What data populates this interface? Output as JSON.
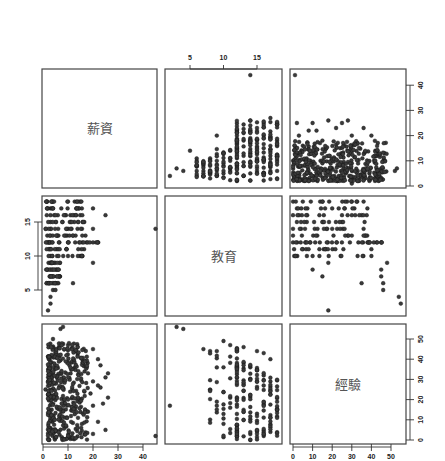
{
  "chart_data": {
    "type": "scatter",
    "subtype": "scatterplot-matrix",
    "title": "",
    "variables": [
      "薪資",
      "教育",
      "經驗"
    ],
    "variable_ranges": {
      "薪資": [
        0,
        45
      ],
      "教育": [
        2,
        18
      ],
      "經驗": [
        0,
        55
      ]
    },
    "axes": {
      "top": {
        "variable": "教育",
        "ticks": [
          5,
          10,
          15
        ]
      },
      "right_row1": {
        "variable": "薪資",
        "ticks": [
          0,
          10,
          20,
          30,
          40
        ]
      },
      "left_row2": {
        "variable": "教育",
        "ticks": [
          5,
          10,
          15
        ]
      },
      "right_row3": {
        "variable": "經驗",
        "ticks": [
          0,
          10,
          20,
          30,
          40,
          50
        ]
      },
      "bottom_col1": {
        "variable": "薪資",
        "ticks": [
          0,
          10,
          20,
          30,
          40
        ]
      },
      "bottom_col3": {
        "variable": "經驗",
        "ticks": [
          0,
          10,
          20,
          30,
          40,
          50
        ]
      }
    },
    "grid": false,
    "legend": null,
    "sample_points": {
      "education_salary": [
        [
          2,
          4
        ],
        [
          3,
          7
        ],
        [
          4,
          6
        ],
        [
          5,
          14
        ],
        [
          6,
          4
        ],
        [
          6,
          6
        ],
        [
          7,
          4
        ],
        [
          7,
          6
        ],
        [
          7,
          8
        ],
        [
          8,
          5
        ],
        [
          8,
          8
        ],
        [
          8,
          11
        ],
        [
          9,
          4
        ],
        [
          9,
          7
        ],
        [
          9,
          10
        ],
        [
          9,
          20
        ],
        [
          10,
          5
        ],
        [
          10,
          8
        ],
        [
          10,
          13
        ],
        [
          11,
          6
        ],
        [
          11,
          10
        ],
        [
          11,
          14
        ],
        [
          12,
          2
        ],
        [
          12,
          5
        ],
        [
          12,
          8
        ],
        [
          12,
          11
        ],
        [
          12,
          15
        ],
        [
          12,
          20
        ],
        [
          12,
          22
        ],
        [
          13,
          4
        ],
        [
          13,
          8
        ],
        [
          13,
          12
        ],
        [
          13,
          18
        ],
        [
          13,
          21
        ],
        [
          14,
          5
        ],
        [
          14,
          9
        ],
        [
          14,
          13
        ],
        [
          14,
          17
        ],
        [
          14,
          22
        ],
        [
          14,
          26
        ],
        [
          14,
          44
        ],
        [
          15,
          6
        ],
        [
          15,
          10
        ],
        [
          15,
          17
        ],
        [
          15,
          23
        ],
        [
          16,
          5
        ],
        [
          16,
          10
        ],
        [
          16,
          15
        ],
        [
          16,
          20
        ],
        [
          16,
          25
        ],
        [
          17,
          6
        ],
        [
          17,
          12
        ],
        [
          17,
          19
        ],
        [
          17,
          27
        ],
        [
          18,
          6
        ],
        [
          18,
          12
        ],
        [
          18,
          18
        ],
        [
          18,
          25
        ]
      ],
      "experience_salary": [
        [
          1,
          44
        ],
        [
          0,
          10
        ],
        [
          2,
          25
        ],
        [
          3,
          20
        ],
        [
          5,
          16
        ],
        [
          8,
          22
        ],
        [
          10,
          25
        ],
        [
          12,
          22
        ],
        [
          15,
          18
        ],
        [
          18,
          26
        ],
        [
          22,
          23
        ],
        [
          25,
          25
        ],
        [
          28,
          26
        ],
        [
          30,
          20
        ],
        [
          33,
          17
        ],
        [
          36,
          23
        ],
        [
          40,
          20
        ],
        [
          42,
          14
        ],
        [
          45,
          7
        ],
        [
          52,
          6
        ],
        [
          53,
          7
        ],
        [
          3,
          5
        ],
        [
          6,
          8
        ],
        [
          9,
          10
        ],
        [
          12,
          7
        ],
        [
          15,
          9
        ],
        [
          18,
          6
        ],
        [
          21,
          11
        ],
        [
          24,
          8
        ],
        [
          27,
          5
        ],
        [
          30,
          9
        ],
        [
          33,
          6
        ],
        [
          36,
          4
        ],
        [
          39,
          5
        ],
        [
          42,
          3
        ],
        [
          30,
          1
        ]
      ],
      "salary_education": [
        [
          2,
          2
        ],
        [
          3,
          3
        ],
        [
          3,
          4
        ],
        [
          4,
          5
        ],
        [
          5,
          5
        ],
        [
          2,
          6
        ],
        [
          3,
          7
        ],
        [
          3,
          8
        ],
        [
          3,
          9
        ],
        [
          3,
          10
        ],
        [
          3,
          11
        ],
        [
          2,
          12
        ],
        [
          3,
          13
        ],
        [
          3,
          14
        ],
        [
          3,
          15
        ],
        [
          3,
          16
        ],
        [
          3,
          17
        ],
        [
          4,
          18
        ],
        [
          10,
          18
        ],
        [
          15,
          18
        ],
        [
          20,
          17
        ],
        [
          25,
          16
        ],
        [
          20,
          14
        ],
        [
          12,
          13
        ],
        [
          17,
          13
        ],
        [
          10,
          12
        ],
        [
          20,
          12
        ],
        [
          45,
          14
        ],
        [
          20,
          9
        ],
        [
          12,
          6
        ],
        [
          14,
          15
        ]
      ],
      "experience_education": [
        [
          5,
          18
        ],
        [
          15,
          18
        ],
        [
          30,
          18
        ],
        [
          36,
          18
        ],
        [
          2,
          17
        ],
        [
          20,
          17
        ],
        [
          0,
          16
        ],
        [
          25,
          16
        ],
        [
          30,
          16
        ],
        [
          35,
          16
        ],
        [
          2,
          15
        ],
        [
          25,
          15
        ],
        [
          0,
          14
        ],
        [
          20,
          14
        ],
        [
          36,
          14
        ],
        [
          0,
          13
        ],
        [
          30,
          13
        ],
        [
          0,
          12
        ],
        [
          45,
          12
        ],
        [
          5,
          11
        ],
        [
          40,
          11
        ],
        [
          10,
          10
        ],
        [
          40,
          10
        ],
        [
          18,
          9
        ],
        [
          48,
          9
        ],
        [
          10,
          8
        ],
        [
          45,
          8
        ],
        [
          15,
          7
        ],
        [
          45,
          7
        ],
        [
          35,
          6
        ],
        [
          46,
          6
        ],
        [
          46,
          5
        ],
        [
          54,
          4
        ],
        [
          55,
          3
        ],
        [
          18,
          2
        ]
      ],
      "salary_experience": [
        [
          7,
          55
        ],
        [
          8,
          56
        ],
        [
          4,
          50
        ],
        [
          10,
          47
        ],
        [
          5,
          45
        ],
        [
          20,
          45
        ],
        [
          13,
          44
        ],
        [
          22,
          40
        ],
        [
          16,
          38
        ],
        [
          23,
          37
        ],
        [
          18,
          33
        ],
        [
          26,
          33
        ],
        [
          25,
          31
        ],
        [
          20,
          29
        ],
        [
          22,
          27
        ],
        [
          1,
          25
        ],
        [
          23,
          26
        ],
        [
          19,
          23
        ],
        [
          26,
          21
        ],
        [
          15,
          20
        ],
        [
          20,
          17
        ],
        [
          24,
          18
        ],
        [
          18,
          14
        ],
        [
          14,
          11
        ],
        [
          22,
          9
        ],
        [
          25,
          5
        ],
        [
          20,
          3
        ],
        [
          10,
          1
        ],
        [
          3,
          6
        ],
        [
          45,
          2
        ]
      ],
      "education_experience": [
        [
          3,
          56
        ],
        [
          4,
          55
        ],
        [
          7,
          45
        ],
        [
          8,
          44
        ],
        [
          9,
          44
        ],
        [
          10,
          49
        ],
        [
          10,
          36
        ],
        [
          10,
          8
        ],
        [
          11,
          47
        ],
        [
          11,
          16
        ],
        [
          12,
          45
        ],
        [
          12,
          2
        ],
        [
          13,
          46
        ],
        [
          13,
          10
        ],
        [
          14,
          36
        ],
        [
          14,
          0
        ],
        [
          15,
          44
        ],
        [
          15,
          29
        ],
        [
          15,
          13
        ],
        [
          16,
          43
        ],
        [
          16,
          2
        ],
        [
          17,
          40
        ],
        [
          17,
          4
        ],
        [
          2,
          17
        ]
      ]
    }
  }
}
